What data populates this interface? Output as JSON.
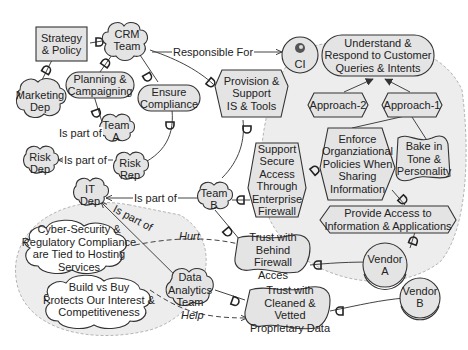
{
  "diagram": {
    "type": "iStar goal model",
    "colors": {
      "node_fill": "#e4e4e4",
      "stroke": "#333333",
      "boundary_fill": "#ededed",
      "boundary_stroke": "#b0b0b0",
      "background": "#ffffff"
    },
    "actors": {
      "strategy_policy": "Strategy\n& Policy",
      "crm_team": "CRM\nTeam",
      "marketing_dep": "Marketing\nDep",
      "team_a": "Team\nA",
      "risk_dep": "Risk\nDep",
      "risk_rep": "Risk\nRep",
      "it_dep": "IT\nDep",
      "team_b": "Team\nB",
      "data_analytics_team": "Data\nAnalytics\nTeam",
      "ci": "CI",
      "vendor_a": "Vendor\nA",
      "vendor_b": "Vendor\nB"
    },
    "goals": {
      "planning_campaigning": "Planning &\nCampaigning",
      "ensure_compliance": "Ensure\nCompliance",
      "understand_respond": "Understand &\nRespond to Customer\nQueries & Intents"
    },
    "tasks": {
      "provision_support": "Provision &\nSupport\nIS & Tools",
      "approach_2": "Approach-2",
      "approach_1": "Approach-1",
      "support_secure_access": "Support\nSecure\nAccess\nThrough\nEnterprise\nFirewall",
      "enforce_policies": "Enforce\nOrganziational\nPolicies When\nSharing\nInformation",
      "provide_access": "Provide Access to\nInformation & Applications"
    },
    "softgoals": {
      "bake_in_tone": "Bake in\nTone &\nPersonality",
      "trust_firewall": "Trust with\nBehind Firewall\nAcces",
      "trust_cleaned": "Trust with\nCleaned & Vetted\nProprietary Data"
    },
    "beliefs": {
      "cyber_security": "Cyber-Security &\nRegulatory Compliance\nare Tied to Hosting\nServices",
      "build_vs_buy": "Build vs Buy\nProtects Our Interest &\nCompetitiveness"
    },
    "edge_labels": {
      "responsible_for": "Responsible For",
      "is_part_of_1": "Is part of",
      "is_part_of_2": "Is part of",
      "is_part_of_3": "Is part of",
      "is_part_of_4": "Is part of",
      "hurt": "Hurt",
      "help": "Help"
    }
  }
}
